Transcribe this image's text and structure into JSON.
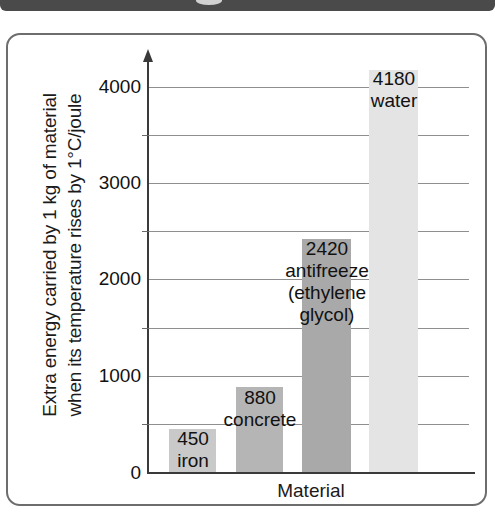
{
  "top_bar": {
    "present": true,
    "color": "#4a4a4a"
  },
  "figure": {
    "border_color": "#6d6d6d",
    "background": "#ffffff"
  },
  "chart_data": {
    "type": "bar",
    "title": "",
    "xlabel": "Material",
    "ylabel": "Extra energy carried by 1 kg of material when its temperature rises by 1°C/joule",
    "ylabel_lines": [
      "Extra energy carried by 1 kg of material",
      "when its temperature rises by 1°C/joule"
    ],
    "categories": [
      "iron",
      "concrete",
      "antifreeze (ethylene glycol)",
      "water"
    ],
    "values": [
      450,
      880,
      2420,
      4180
    ],
    "value_labels": [
      "450",
      "880",
      "2420",
      "4180"
    ],
    "name_labels": [
      [
        "iron"
      ],
      [
        "concrete"
      ],
      [
        "antifreeze",
        "(ethylene",
        "glycol)"
      ],
      [
        "water"
      ]
    ],
    "bar_colors": [
      "#c9c9c9",
      "#b5b5b5",
      "#a9a9a9",
      "#e4e4e4"
    ],
    "ylim": [
      0,
      4400
    ],
    "yticks": [
      0,
      1000,
      2000,
      3000,
      4000
    ],
    "ytick_labels": [
      "0",
      "1000",
      "2000",
      "3000",
      "4000"
    ],
    "yminor_ticks": [
      500,
      1500,
      2500,
      3500
    ],
    "grid": true,
    "grid_values": [
      500,
      1000,
      1500,
      2000,
      2500,
      3000,
      3500,
      4000
    ],
    "legend": "none",
    "grid_color": "#8f8f8f",
    "axis_color": "#3a3a3a"
  },
  "axis": {
    "y_arrow": "arrow-up-icon",
    "x_title": "Material"
  }
}
